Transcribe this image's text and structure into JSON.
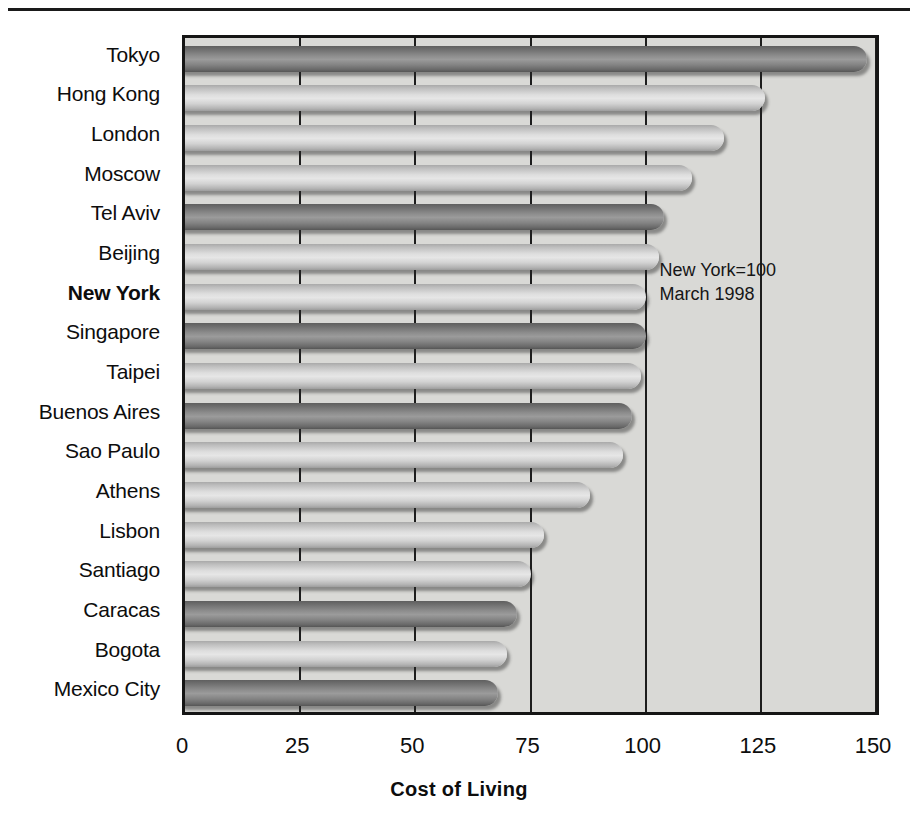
{
  "chart_data": {
    "type": "bar",
    "orientation": "horizontal",
    "title": "",
    "xlabel": "Cost of Living",
    "ylabel": "",
    "xlim": [
      0,
      150
    ],
    "xticks": [
      0,
      25,
      50,
      75,
      100,
      125,
      150
    ],
    "grid": true,
    "legend": "none",
    "annotations": [
      "New York=100",
      "March 1998"
    ],
    "highlight_category": "New York",
    "categories": [
      "Tokyo",
      "Hong Kong",
      "London",
      "Moscow",
      "Tel Aviv",
      "Beijing",
      "New York",
      "Singapore",
      "Taipei",
      "Buenos Aires",
      "Sao Paulo",
      "Athens",
      "Lisbon",
      "Santiago",
      "Caracas",
      "Bogota",
      "Mexico City"
    ],
    "values": [
      148,
      126,
      117,
      110,
      104,
      103,
      100,
      100,
      99,
      97,
      95,
      88,
      78,
      75,
      72,
      70,
      68
    ],
    "bar_shades": [
      "dark",
      "light",
      "light",
      "light",
      "dark",
      "light",
      "light",
      "dark",
      "light",
      "dark",
      "light",
      "light",
      "light",
      "light",
      "dark",
      "light",
      "dark"
    ]
  },
  "axis": {
    "x_tick_labels": [
      "0",
      "25",
      "50",
      "75",
      "100",
      "125",
      "150"
    ]
  },
  "annotation": {
    "line1": "New York=100",
    "line2": "March 1998"
  },
  "colors": {
    "plot_background": "#d9d9d6",
    "plot_border": "#151515",
    "gridline": "#1d1d1d",
    "text": "#0d0d0d",
    "bar_dark": "#8d8d8d",
    "bar_light": "#dedede"
  }
}
